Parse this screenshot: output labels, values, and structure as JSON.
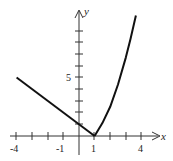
{
  "chart_data": {
    "type": "line",
    "title": "",
    "xlabel": "x",
    "ylabel": "y",
    "xlim": [
      -4,
      4.6
    ],
    "ylim": [
      -1,
      10.5
    ],
    "x_ticks": [
      -4,
      -3,
      -2,
      -1,
      1,
      2,
      3,
      4
    ],
    "x_tick_labels": [
      {
        "value": -4,
        "label": "-4"
      },
      {
        "value": -1,
        "label": "-1"
      },
      {
        "value": 1,
        "label": "1"
      },
      {
        "value": 4,
        "label": "4"
      }
    ],
    "y_ticks": [
      1,
      2,
      3,
      4,
      5,
      6,
      7,
      8,
      9
    ],
    "y_tick_labels": [
      {
        "value": 5,
        "label": "5"
      }
    ],
    "grid": false,
    "legend": null,
    "series": [
      {
        "name": "left-linear-piece",
        "x": [
          -4,
          1
        ],
        "y": [
          5,
          0
        ]
      },
      {
        "name": "right-curve-piece",
        "x": [
          1,
          1.5,
          2,
          2.5,
          3,
          3.3,
          3.65
        ],
        "y": [
          0,
          1.1,
          2.5,
          4.4,
          6.7,
          8.3,
          10.3
        ]
      }
    ]
  },
  "axes": {
    "x_label": "x",
    "y_label": "y",
    "tick_label_neg4": "-4",
    "tick_label_neg1": "-1",
    "tick_label_1": "1",
    "tick_label_4": "4",
    "tick_label_y5": "5"
  },
  "colors": {
    "line": "#111111",
    "axis": "#333333"
  }
}
